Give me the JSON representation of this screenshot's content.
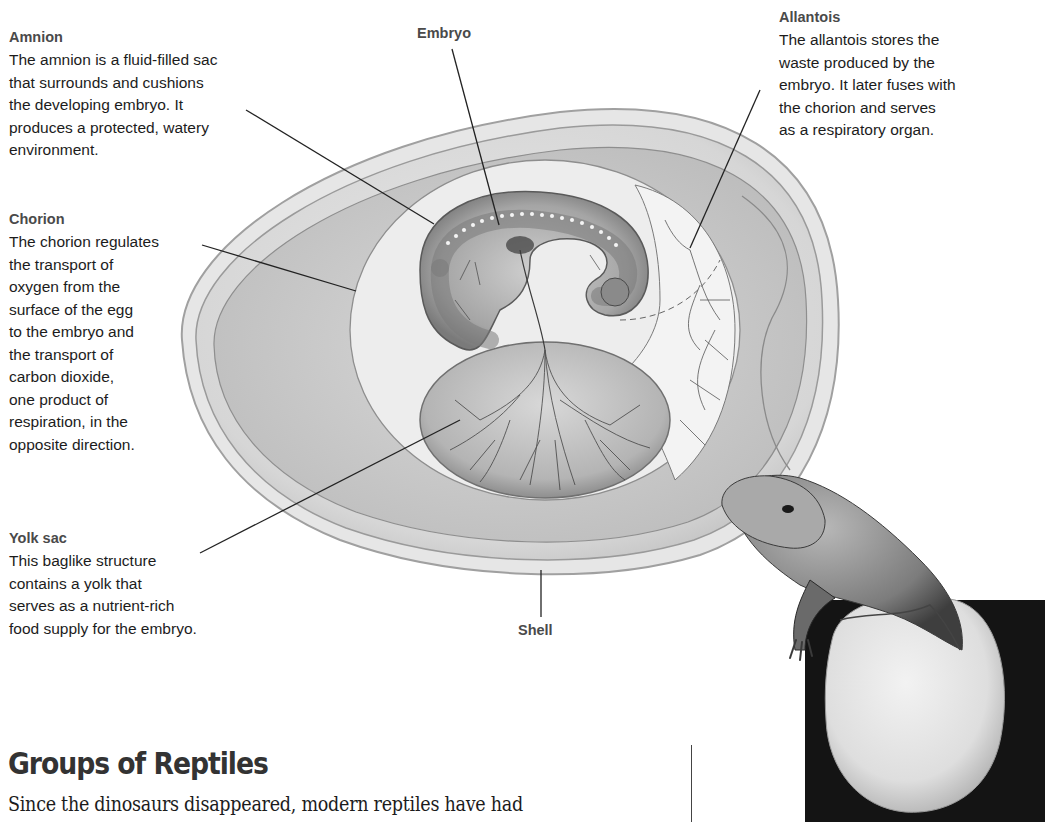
{
  "diagram": {
    "labels": {
      "amnion": {
        "title": "Amnion",
        "body": "The amnion is a fluid-filled sac\nthat surrounds and cushions\nthe developing embryo. It\nproduces a protected, watery\nenvironment."
      },
      "embryo": {
        "title": "Embryo"
      },
      "allantois": {
        "title": "Allantois",
        "body": "The allantois stores the\nwaste produced by the\nembryo. It later fuses with\nthe chorion and serves\nas a respiratory organ."
      },
      "chorion": {
        "title": "Chorion",
        "body": "The chorion regulates\nthe transport of\noxygen from the\nsurface of the egg\nto the embryo and\nthe transport of\ncarbon dioxide,\none product of\nrespiration, in the\nopposite direction."
      },
      "yolk_sac": {
        "title": "Yolk sac",
        "body": "This baglike structure\ncontains a yolk that\nserves as a nutrient-rich\nfood supply for the embryo."
      },
      "shell": {
        "title": "Shell"
      }
    },
    "colors": {
      "shell_outer": "#e4e4e4",
      "shell_edge": "#9a9a9a",
      "albumen": "#cfcfcf",
      "chorion_space": "#ececec",
      "amnion": "#9c9c9c",
      "yolk": "#bdbdbd",
      "vessels": "#4a4a4a",
      "leader_line": "#222222"
    }
  },
  "photo": {
    "subject": "Lizard hatching from egg"
  },
  "section": {
    "heading": "Groups of Reptiles",
    "body_start": "Since the dinosaurs disappeared, modern reptiles have had"
  }
}
